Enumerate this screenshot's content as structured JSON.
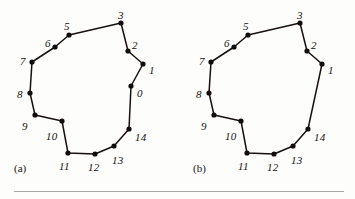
{
  "figure": {
    "background_color": "#fdfdfc",
    "ink_color": "#16110f",
    "rule_color": "#a9a6a2",
    "panels": [
      {
        "id": "a",
        "caption": "(a)",
        "caption_pos": [
          14,
          163
        ],
        "origin": [
          0,
          0
        ],
        "closed": true,
        "vertices": [
          {
            "label": "0",
            "x": 131,
            "y": 86,
            "lx": 137,
            "ly": 88
          },
          {
            "label": "1",
            "x": 143,
            "y": 64,
            "lx": 149,
            "ly": 65
          },
          {
            "label": "2",
            "x": 128,
            "y": 51,
            "lx": 132,
            "ly": 40
          },
          {
            "label": "3",
            "x": 121,
            "y": 23,
            "lx": 118,
            "ly": 10
          },
          {
            "label": "5",
            "x": 69,
            "y": 35,
            "lx": 64,
            "ly": 21
          },
          {
            "label": "6",
            "x": 55,
            "y": 47,
            "lx": 45,
            "ly": 38
          },
          {
            "label": "7",
            "x": 32,
            "y": 62,
            "lx": 20,
            "ly": 56
          },
          {
            "label": "8",
            "x": 30,
            "y": 93,
            "lx": 17,
            "ly": 89
          },
          {
            "label": "9",
            "x": 35,
            "y": 115,
            "lx": 22,
            "ly": 121
          },
          {
            "label": "10",
            "x": 62,
            "y": 121,
            "lx": 46,
            "ly": 131
          },
          {
            "label": "11",
            "x": 68,
            "y": 153,
            "lx": 59,
            "ly": 161
          },
          {
            "label": "12",
            "x": 95,
            "y": 154,
            "lx": 88,
            "ly": 162
          },
          {
            "label": "13",
            "x": 114,
            "y": 146,
            "lx": 112,
            "ly": 155
          },
          {
            "label": "14",
            "x": 129,
            "y": 129,
            "lx": 135,
            "ly": 132
          }
        ]
      },
      {
        "id": "b",
        "caption": "(b)",
        "caption_pos": [
          193,
          163
        ],
        "origin": [
          179,
          0
        ],
        "closed": true,
        "vertices": [
          {
            "label": "1",
            "x": 322,
            "y": 64,
            "lx": 328,
            "ly": 65
          },
          {
            "label": "2",
            "x": 307,
            "y": 51,
            "lx": 311,
            "ly": 40
          },
          {
            "label": "3",
            "x": 300,
            "y": 23,
            "lx": 297,
            "ly": 10
          },
          {
            "label": "5",
            "x": 248,
            "y": 35,
            "lx": 243,
            "ly": 21
          },
          {
            "label": "6",
            "x": 234,
            "y": 47,
            "lx": 224,
            "ly": 38
          },
          {
            "label": "7",
            "x": 211,
            "y": 62,
            "lx": 199,
            "ly": 56
          },
          {
            "label": "8",
            "x": 209,
            "y": 93,
            "lx": 196,
            "ly": 89
          },
          {
            "label": "9",
            "x": 214,
            "y": 115,
            "lx": 201,
            "ly": 121
          },
          {
            "label": "10",
            "x": 241,
            "y": 121,
            "lx": 225,
            "ly": 131
          },
          {
            "label": "11",
            "x": 247,
            "y": 153,
            "lx": 238,
            "ly": 161
          },
          {
            "label": "12",
            "x": 274,
            "y": 154,
            "lx": 267,
            "ly": 162
          },
          {
            "label": "13",
            "x": 293,
            "y": 146,
            "lx": 291,
            "ly": 155
          },
          {
            "label": "14",
            "x": 308,
            "y": 129,
            "lx": 314,
            "ly": 132
          }
        ]
      }
    ]
  }
}
